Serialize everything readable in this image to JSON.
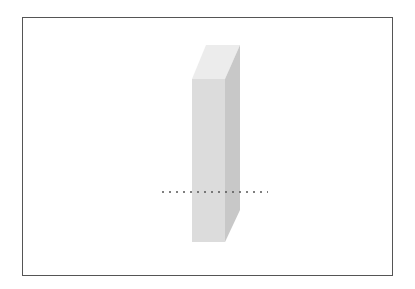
{
  "diagram": {
    "type": "3d-rectangular-prism",
    "colors": {
      "frame_border": "#555555",
      "top_face": "#ececec",
      "front_face": "#dcdcdc",
      "side_face": "#c8c8c8",
      "dotted_line": "#555555"
    },
    "elements": [
      {
        "name": "prism",
        "description": "tall rectangular block in perspective"
      },
      {
        "name": "horizontal-dotted-line",
        "description": "dashed line crossing the block near its lower third"
      }
    ]
  }
}
